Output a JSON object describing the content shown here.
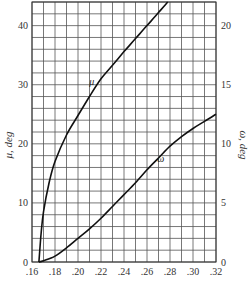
{
  "chart_data": {
    "type": "line",
    "title": "",
    "xlabel": "",
    "ylabel": "μ, deg",
    "ylabel_right": "ω, deg",
    "xlim": [
      0.16,
      0.32
    ],
    "ylim": [
      0,
      44
    ],
    "ylim_right": [
      0,
      22
    ],
    "grid": true,
    "x_ticks": [
      ".16",
      ".18",
      ".20",
      ".22",
      ".24",
      ".26",
      ".28",
      ".30",
      ".32"
    ],
    "y_ticks_left": [
      "0",
      "10",
      "20",
      "30",
      "40"
    ],
    "y_ticks_right": [
      "0",
      "5",
      "10",
      "15",
      "20"
    ],
    "series": [
      {
        "name": "μ",
        "axis": "left",
        "x": [
          0.166,
          0.168,
          0.17,
          0.175,
          0.18,
          0.19,
          0.2,
          0.21,
          0.22,
          0.23,
          0.24,
          0.25,
          0.26,
          0.27,
          0.278
        ],
        "y": [
          0,
          5,
          8.5,
          13.5,
          17,
          21.5,
          24.8,
          28,
          31,
          33.3,
          35.6,
          37.8,
          40,
          42.2,
          44
        ]
      },
      {
        "name": "ω",
        "axis": "right",
        "x": [
          0.166,
          0.17,
          0.18,
          0.19,
          0.2,
          0.21,
          0.22,
          0.23,
          0.24,
          0.25,
          0.26,
          0.27,
          0.28,
          0.29,
          0.3,
          0.31,
          0.32
        ],
        "y": [
          0,
          0.1,
          0.5,
          1.2,
          2.0,
          2.8,
          3.7,
          4.7,
          5.7,
          6.7,
          7.8,
          8.8,
          9.8,
          10.6,
          11.3,
          11.9,
          12.5
        ]
      }
    ],
    "annotations": [
      {
        "text": "μ",
        "x": 0.212,
        "y": 30
      },
      {
        "text": "ω",
        "x": 0.272,
        "y": 8.5
      }
    ]
  }
}
